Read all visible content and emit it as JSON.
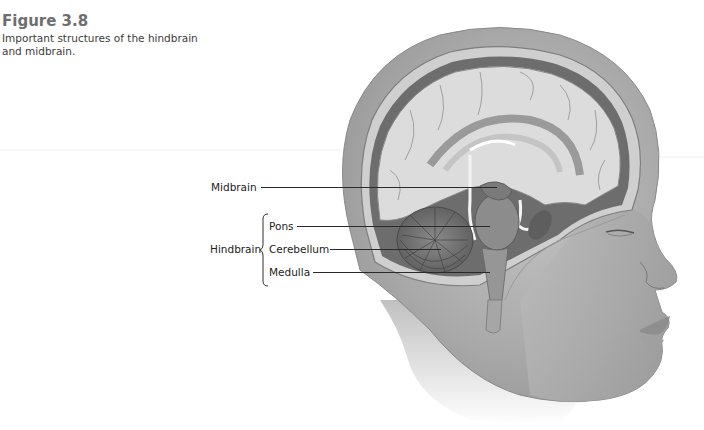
{
  "figure": {
    "title": "Figure 3.8",
    "description": "Important structures of the hindbrain and midbrain."
  },
  "labels": {
    "midbrain": "Midbrain",
    "hindbrain": "Hindbrain",
    "pons": "Pons",
    "cerebellum": "Cerebellum",
    "medulla": "Medulla"
  },
  "colors": {
    "title": "#6e6e6e",
    "text": "#222222",
    "leader": "#2a2a2a",
    "skin": "#bdbdbd",
    "brain": "#d9d9d9"
  }
}
